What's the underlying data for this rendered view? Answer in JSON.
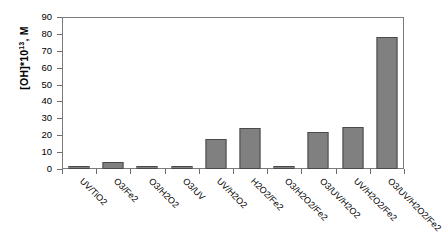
{
  "chart_data": {
    "type": "bar",
    "title": "",
    "xlabel": "",
    "ylabel": "[OH]*10^13, M",
    "ylabel_base": "[OH]*10",
    "ylabel_exponent": "13",
    "ylabel_suffix": ", M",
    "ylim": [
      0,
      90
    ],
    "ytick_step": 10,
    "grid": false,
    "legend": "none",
    "bar_color": "#808080",
    "bar_edge_color": "#4a4a4a",
    "axis_color": "#7b7b7b",
    "categories": [
      "UV/TiO2",
      "O3/Fe2",
      "O3/H2O2",
      "O3/UV",
      "UV/H2O2",
      "H2O2/Fe2",
      "O3/H2O2/Fe2",
      "O3/UV/H2O2",
      "UV/H2O2/Fe2",
      "O3/UV/H2O2/Fe2"
    ],
    "values": [
      2,
      4,
      2,
      1.5,
      18,
      24,
      2,
      22,
      25,
      78
    ],
    "yticks": [
      0,
      10,
      20,
      30,
      40,
      50,
      60,
      70,
      80,
      90
    ]
  }
}
